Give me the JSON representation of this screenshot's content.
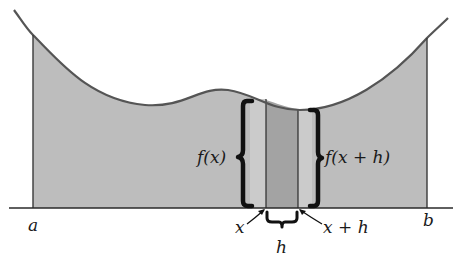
{
  "figure": {
    "colors": {
      "background": "#ffffff",
      "region_fill": "#bdbdbd",
      "strip_light": "#c9c9c9",
      "strip_dark": "#a3a3a3",
      "curve": "#555555",
      "ink": "#1a1a1a"
    },
    "labels": {
      "a": "a",
      "b": "b",
      "x": "x",
      "x_plus_h": "x + h",
      "h": "h",
      "f_x": "f(x)",
      "f_x_plus_h": "f(x + h)"
    }
  }
}
